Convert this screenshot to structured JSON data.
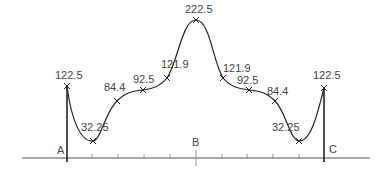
{
  "diagram": {
    "type": "symmetric-curve-profile",
    "axis_labels": {
      "left": "A",
      "middle": "B",
      "right": "C"
    },
    "points": [
      {
        "label": "122.5",
        "x": 67,
        "y": 86,
        "lx": 55,
        "ly": 79
      },
      {
        "label": "32.25",
        "x": 93,
        "y": 141,
        "lx": 81,
        "ly": 131
      },
      {
        "label": "84.4",
        "x": 117,
        "y": 101,
        "lx": 104,
        "ly": 91
      },
      {
        "label": "92.5",
        "x": 143,
        "y": 90,
        "lx": 133,
        "ly": 83
      },
      {
        "label": "121.9",
        "x": 167,
        "y": 78,
        "lx": 161,
        "ly": 68
      },
      {
        "label": "222.5",
        "x": 196,
        "y": 20,
        "lx": 185,
        "ly": 13
      },
      {
        "label": "121.9",
        "x": 223,
        "y": 78,
        "lx": 223,
        "ly": 72
      },
      {
        "label": "92.5",
        "x": 249,
        "y": 90,
        "lx": 237,
        "ly": 84
      },
      {
        "label": "84.4",
        "x": 275,
        "y": 101,
        "lx": 267,
        "ly": 95
      },
      {
        "label": "32.25",
        "x": 299,
        "y": 141,
        "lx": 272,
        "ly": 131
      },
      {
        "label": "122.5",
        "x": 324,
        "y": 88,
        "lx": 313,
        "ly": 79
      }
    ]
  }
}
